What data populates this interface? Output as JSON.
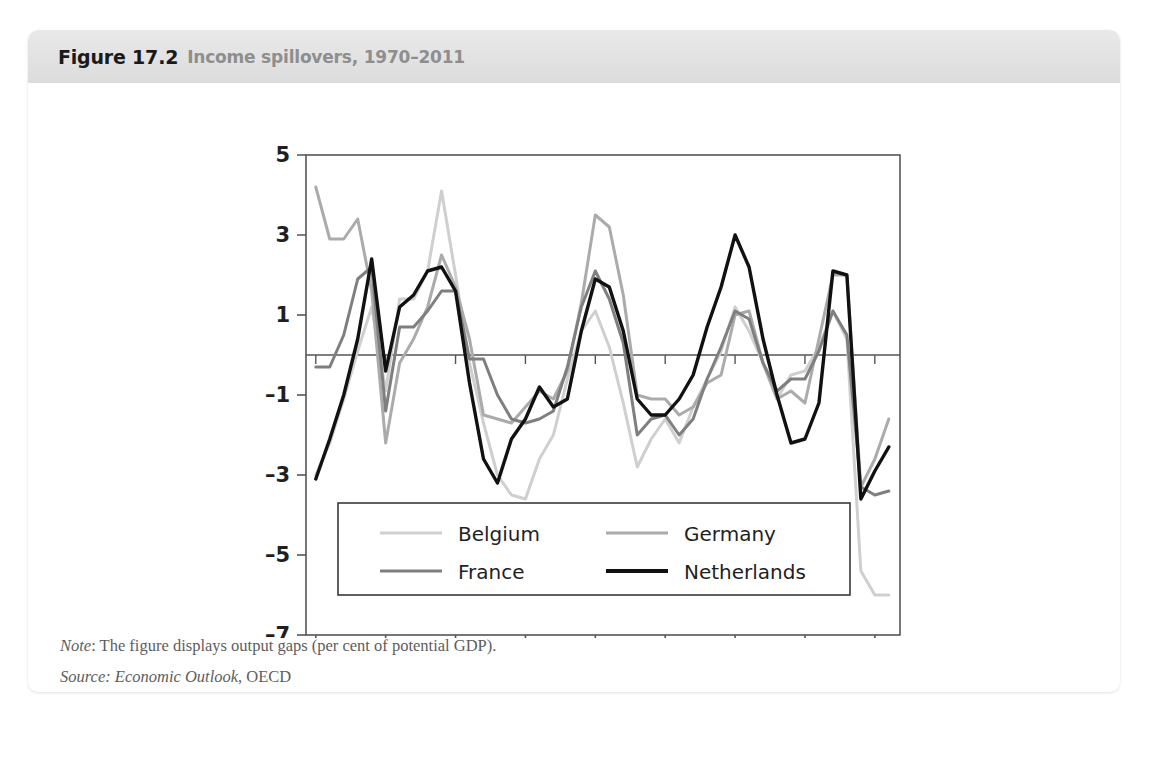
{
  "figure": {
    "number": "Figure 17.2",
    "caption": "Income spillovers, 1970–2011",
    "note_label": "Note",
    "note_text": ": The figure displays output gaps (per cent of potential GDP).",
    "source_label": "Source",
    "source_italic": ": Economic Outlook",
    "source_rest": ", OECD"
  },
  "colors": {
    "belgium": "#cfcfcf",
    "france": "#7f7f7f",
    "germany": "#ababab",
    "netherlands": "#111111",
    "axis": "#555555",
    "header_band": "#e4e4e4",
    "caption_gray": "#8e8e8e",
    "note_gray": "#5d5d5d"
  },
  "chart_data": {
    "type": "line",
    "title": "Income spillovers, 1970–2011",
    "xlabel": "",
    "ylabel": "",
    "xlim": [
      1969.3,
      2011.8
    ],
    "ylim": [
      -7,
      5
    ],
    "yticks": [
      5,
      3,
      1,
      -1,
      -3,
      -5,
      -7
    ],
    "ytick_labels": [
      "5",
      "3",
      "1",
      "–1",
      "–3",
      "–5",
      "–7"
    ],
    "xticks": [
      1970,
      1975,
      1980,
      1985,
      1990,
      1995,
      2000,
      2005,
      2010
    ],
    "xtick_labels": [
      "1970",
      "1975",
      "1980",
      "1985",
      "1990",
      "1995",
      "2000",
      "2005",
      "2010"
    ],
    "grid": false,
    "zero_line": true,
    "legend_position": "inside-bottom-left",
    "x": [
      1970,
      1971,
      1972,
      1973,
      1974,
      1975,
      1976,
      1977,
      1978,
      1979,
      1980,
      1981,
      1982,
      1983,
      1984,
      1985,
      1986,
      1987,
      1988,
      1989,
      1990,
      1991,
      1992,
      1993,
      1994,
      1995,
      1996,
      1997,
      1998,
      1999,
      2000,
      2001,
      2002,
      2003,
      2004,
      2005,
      2006,
      2007,
      2008,
      2009,
      2010,
      2011
    ],
    "series": [
      {
        "name": "Belgium",
        "color": "#cfcfcf",
        "values": [
          -3.0,
          -2.2,
          -1.1,
          0.1,
          1.2,
          -0.9,
          1.4,
          1.4,
          2.1,
          4.1,
          2.0,
          -0.2,
          -1.7,
          -3.0,
          -3.5,
          -3.6,
          -2.6,
          -2.0,
          -0.6,
          0.6,
          1.1,
          0.2,
          -1.2,
          -2.8,
          -2.1,
          -1.6,
          -2.2,
          -1.3,
          -0.6,
          0.1,
          1.2,
          0.6,
          -0.2,
          -1.1,
          -0.5,
          -0.4,
          0.2,
          1.1,
          0.4,
          -5.4,
          -6.0,
          -6.0
        ]
      },
      {
        "name": "France",
        "color": "#7f7f7f",
        "values": [
          -0.3,
          -0.3,
          0.5,
          1.9,
          2.2,
          -1.4,
          0.7,
          0.7,
          1.1,
          1.6,
          1.6,
          -0.1,
          -0.1,
          -1.0,
          -1.6,
          -1.7,
          -1.6,
          -1.4,
          -0.3,
          1.2,
          2.1,
          1.4,
          0.3,
          -2.0,
          -1.6,
          -1.5,
          -2.0,
          -1.6,
          -0.6,
          0.2,
          1.1,
          0.9,
          -0.2,
          -0.9,
          -0.6,
          -0.6,
          0.1,
          1.1,
          0.5,
          -3.3,
          -3.5,
          -3.4
        ]
      },
      {
        "name": "Germany",
        "color": "#ababab",
        "values": [
          4.2,
          2.9,
          2.9,
          3.4,
          1.6,
          -2.2,
          -0.2,
          0.4,
          1.2,
          2.5,
          1.7,
          0.4,
          -1.5,
          -1.6,
          -1.7,
          -1.3,
          -0.9,
          -1.1,
          -0.4,
          1.3,
          3.5,
          3.2,
          1.5,
          -1.0,
          -1.1,
          -1.1,
          -1.5,
          -1.3,
          -0.7,
          -0.5,
          1.0,
          1.1,
          -0.2,
          -1.1,
          -0.9,
          -1.2,
          0.4,
          2.0,
          2.0,
          -3.3,
          -2.6,
          -1.6
        ]
      },
      {
        "name": "Netherlands",
        "color": "#111111",
        "values": [
          -3.1,
          -2.1,
          -1.0,
          0.4,
          2.4,
          -0.4,
          1.2,
          1.5,
          2.1,
          2.2,
          1.6,
          -0.7,
          -2.6,
          -3.2,
          -2.1,
          -1.6,
          -0.8,
          -1.3,
          -1.1,
          0.6,
          1.9,
          1.7,
          0.6,
          -1.1,
          -1.5,
          -1.5,
          -1.1,
          -0.5,
          0.7,
          1.7,
          3.0,
          2.2,
          0.4,
          -1.0,
          -2.2,
          -2.1,
          -1.2,
          2.1,
          2.0,
          -3.6,
          -2.9,
          -2.3
        ]
      }
    ]
  },
  "legend": {
    "entries": [
      {
        "label": "Belgium",
        "color_key": "belgium"
      },
      {
        "label": "Germany",
        "color_key": "germany"
      },
      {
        "label": "France",
        "color_key": "france"
      },
      {
        "label": "Netherlands",
        "color_key": "netherlands"
      }
    ]
  }
}
